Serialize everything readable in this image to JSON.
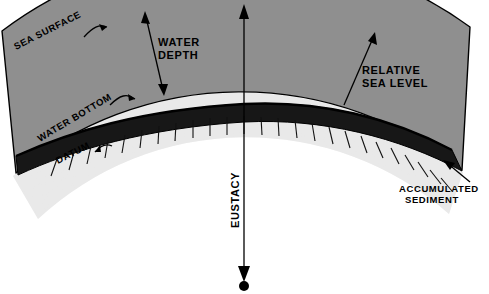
{
  "figure": {
    "type": "geology-cross-section-diagram",
    "width": 489,
    "height": 294
  },
  "colors": {
    "background": "#ffffff",
    "water": "#8f8f8f",
    "sediment": "#171717",
    "crust": "#ededed",
    "outline": "#000000",
    "text": "#000000",
    "tick": "#111111"
  },
  "labels": {
    "sea_surface": "SEA SURFACE",
    "water_depth_line1": "WATER",
    "water_depth_line2": "DEPTH",
    "relative_sea_level_line1": "RELATIVE",
    "relative_sea_level_line2": "SEA LEVEL",
    "water_bottom": "WATER BOTTOM",
    "datum": "DATUM",
    "eustacy": "EUSTACY",
    "accumulated_sediment_line1": "ACCUMULATED",
    "accumulated_sediment_line2": "SEDIMENT"
  },
  "layers": [
    {
      "name": "water",
      "label": "sea water column",
      "fill": "#8f8f8f"
    },
    {
      "name": "accumulated-sediment",
      "label": "accumulated sediment wedge",
      "fill": "#171717"
    },
    {
      "name": "crust",
      "label": "underlying crust / datum block",
      "fill": "#ededed"
    }
  ],
  "annotations": [
    {
      "name": "sea-surface",
      "text": "SEA SURFACE",
      "arrow": "leader-curved",
      "points_to": "outer arc (sea surface)"
    },
    {
      "name": "water-depth",
      "text": "WATER DEPTH",
      "arrow": "double-headed",
      "spans": "sea surface to water bottom"
    },
    {
      "name": "relative-sea-level",
      "text": "RELATIVE SEA LEVEL",
      "arrow": "single-headed-up",
      "spans": "datum/sediment top to sea surface"
    },
    {
      "name": "water-bottom",
      "text": "WATER BOTTOM",
      "arrow": "leader-curved",
      "points_to": "top of sediment band"
    },
    {
      "name": "datum",
      "text": "DATUM",
      "arrow": "leader-curved",
      "points_to": "base of sediment band"
    },
    {
      "name": "eustacy",
      "text": "EUSTACY",
      "arrow": "double-headed-vertical",
      "spans": "sea surface to earth centre dot"
    },
    {
      "name": "accumulated-sediment",
      "text": "ACCUMULATED SEDIMENT",
      "arrow": "single-headed",
      "points_to": "thick right-hand sediment wedge"
    }
  ]
}
